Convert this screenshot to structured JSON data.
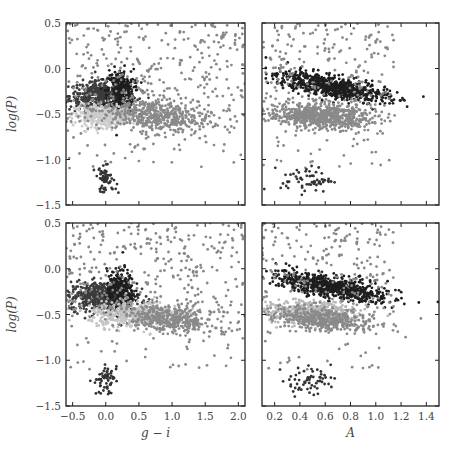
{
  "chart_data": [
    {
      "panel": "top-left",
      "type": "scatter",
      "xlabel": "",
      "ylabel": "log(P)",
      "xlim": [
        -0.6,
        2.1
      ],
      "ylim": [
        -1.5,
        0.5
      ],
      "xticks": [
        "-0.5",
        "0.0",
        "0.5",
        "1.0",
        "1.5",
        "2.0"
      ],
      "yticks": [
        "0.5",
        "0.0",
        "-0.5",
        "-1.0",
        "-1.5"
      ],
      "series": [
        {
          "name": "group-dark",
          "color": "#3c3c3c",
          "center": [
            -0.05,
            -0.3
          ],
          "spread": [
            0.25,
            0.08
          ],
          "n": 500
        },
        {
          "name": "group-black",
          "color": "#1e1e1e",
          "center": [
            0.22,
            -0.25
          ],
          "spread": [
            0.1,
            0.12
          ],
          "n": 300
        },
        {
          "name": "group-light",
          "color": "#cccccc",
          "center": [
            -0.02,
            -0.52
          ],
          "spread": [
            0.22,
            0.06
          ],
          "n": 400
        },
        {
          "name": "group-mid",
          "color": "#8a8a8a",
          "center": [
            0.75,
            -0.52
          ],
          "spread": [
            0.4,
            0.09
          ],
          "n": 500
        },
        {
          "name": "group-scatter",
          "color": "#888888",
          "center": [
            0.9,
            -0.2
          ],
          "spread": [
            0.6,
            0.35
          ],
          "n": 350
        },
        {
          "name": "group-low",
          "color": "#333333",
          "center": [
            0.0,
            -1.22
          ],
          "spread": [
            0.08,
            0.07
          ],
          "n": 60
        }
      ]
    },
    {
      "panel": "top-right",
      "type": "scatter",
      "xlabel": "",
      "ylabel": "",
      "xlim": [
        0.1,
        1.5
      ],
      "ylim": [
        -1.5,
        0.5
      ],
      "xticks": [
        "0.2",
        "0.4",
        "0.6",
        "0.8",
        "1.0",
        "1.2",
        "1.4"
      ],
      "yticks": [],
      "series": [
        {
          "name": "group-black",
          "color": "#1e1e1e",
          "center": [
            0.65,
            -0.2
          ],
          "spread": [
            0.22,
            0.06
          ],
          "n": 700
        },
        {
          "name": "group-mid",
          "color": "#8a8a8a",
          "center": [
            0.55,
            -0.52
          ],
          "spread": [
            0.2,
            0.07
          ],
          "n": 700
        },
        {
          "name": "group-scatter",
          "color": "#888888",
          "center": [
            0.5,
            0.0
          ],
          "spread": [
            0.2,
            0.25
          ],
          "n": 250
        },
        {
          "name": "group-low",
          "color": "#333333",
          "center": [
            0.45,
            -1.22
          ],
          "spread": [
            0.1,
            0.07
          ],
          "n": 60
        }
      ]
    },
    {
      "panel": "bottom-left",
      "type": "scatter",
      "xlabel": "g − i",
      "ylabel": "log(P)",
      "xlim": [
        -0.6,
        2.1
      ],
      "ylim": [
        -1.5,
        0.5
      ],
      "xticks": [
        "-0.5",
        "0.0",
        "0.5",
        "1.0",
        "1.5",
        "2.0"
      ],
      "yticks": [
        "0.5",
        "0.0",
        "-0.5",
        "-1.0",
        "-1.5"
      ],
      "series": [
        {
          "name": "group-dark",
          "color": "#3c3c3c",
          "center": [
            -0.05,
            -0.3
          ],
          "spread": [
            0.25,
            0.08
          ],
          "n": 500
        },
        {
          "name": "group-black",
          "color": "#1e1e1e",
          "center": [
            0.22,
            -0.25
          ],
          "spread": [
            0.1,
            0.12
          ],
          "n": 300
        },
        {
          "name": "group-light",
          "color": "#c4c4c4",
          "center": [
            0.45,
            -0.5
          ],
          "spread": [
            0.35,
            0.07
          ],
          "n": 450
        },
        {
          "name": "group-mid",
          "color": "#8a8a8a",
          "center": [
            0.95,
            -0.55
          ],
          "spread": [
            0.35,
            0.07
          ],
          "n": 400
        },
        {
          "name": "group-scatter",
          "color": "#888888",
          "center": [
            0.9,
            -0.2
          ],
          "spread": [
            0.6,
            0.35
          ],
          "n": 350
        },
        {
          "name": "group-low",
          "color": "#333333",
          "center": [
            0.0,
            -1.22
          ],
          "spread": [
            0.08,
            0.07
          ],
          "n": 60
        }
      ]
    },
    {
      "panel": "bottom-right",
      "type": "scatter",
      "xlabel": "A",
      "ylabel": "",
      "xlim": [
        0.1,
        1.5
      ],
      "ylim": [
        -1.5,
        0.5
      ],
      "xticks": [
        "0.2",
        "0.4",
        "0.6",
        "0.8",
        "1.0",
        "1.2",
        "1.4"
      ],
      "yticks": [],
      "series": [
        {
          "name": "group-black",
          "color": "#1e1e1e",
          "center": [
            0.65,
            -0.2
          ],
          "spread": [
            0.22,
            0.06
          ],
          "n": 700
        },
        {
          "name": "group-light",
          "color": "#b8b8b8",
          "center": [
            0.5,
            -0.48
          ],
          "spread": [
            0.18,
            0.06
          ],
          "n": 450
        },
        {
          "name": "group-mid",
          "color": "#8a8a8a",
          "center": [
            0.6,
            -0.56
          ],
          "spread": [
            0.2,
            0.06
          ],
          "n": 400
        },
        {
          "name": "group-scatter",
          "color": "#888888",
          "center": [
            0.5,
            0.0
          ],
          "spread": [
            0.2,
            0.25
          ],
          "n": 250
        },
        {
          "name": "group-low",
          "color": "#333333",
          "center": [
            0.45,
            -1.22
          ],
          "spread": [
            0.1,
            0.07
          ],
          "n": 60
        }
      ]
    }
  ],
  "layout": {
    "panels": [
      {
        "x": 66,
        "y": 23,
        "w": 179,
        "h": 182
      },
      {
        "x": 262,
        "y": 23,
        "w": 177,
        "h": 182
      },
      {
        "x": 66,
        "y": 223,
        "w": 179,
        "h": 183
      },
      {
        "x": 262,
        "y": 223,
        "w": 177,
        "h": 183
      }
    ]
  }
}
